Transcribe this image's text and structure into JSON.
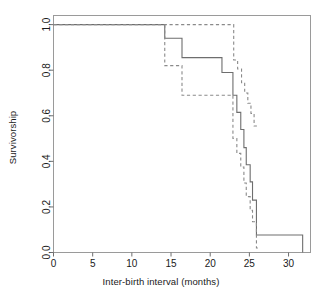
{
  "chart_data": {
    "type": "line",
    "title": "",
    "xlabel": "Inter-birth interval (months)",
    "ylabel": "Survivorship",
    "xlim": [
      0,
      32.8
    ],
    "ylim": [
      0,
      1.04
    ],
    "xticks": [
      0,
      5,
      10,
      15,
      20,
      25,
      30
    ],
    "xticklabels": [
      "0",
      "5",
      "10",
      "15",
      "20",
      "25",
      "30"
    ],
    "yticks": [
      0.0,
      0.2,
      0.4,
      0.6,
      0.8,
      1.0
    ],
    "yticklabels": [
      "0.0",
      "0.2",
      "0.4",
      "0.6",
      "0.8",
      "1.0"
    ],
    "grid": false,
    "legend": null,
    "frame": "box",
    "series": [
      {
        "name": "Survivorship estimate",
        "style": "solid",
        "color": "#6e6e6e",
        "step": "post",
        "x": [
          0,
          14.2,
          14.2,
          16.4,
          16.4,
          21.5,
          21.5,
          22.9,
          22.9,
          23.4,
          23.4,
          23.9,
          23.9,
          24.3,
          24.3,
          24.6,
          24.6,
          25.1,
          25.1,
          25.4,
          25.4,
          25.9,
          25.9,
          31.8,
          31.8
        ],
        "y": [
          1.0,
          1.0,
          0.94,
          0.94,
          0.855,
          0.855,
          0.79,
          0.79,
          0.69,
          0.69,
          0.615,
          0.615,
          0.54,
          0.54,
          0.46,
          0.46,
          0.385,
          0.385,
          0.31,
          0.31,
          0.23,
          0.23,
          0.077,
          0.077,
          0.0
        ]
      },
      {
        "name": "Upper confidence limit",
        "style": "dashed",
        "color": "#8a8a8a",
        "step": "post",
        "x": [
          0,
          14.2,
          14.2,
          23.0,
          23.0,
          23.5,
          23.5,
          24.0,
          24.0,
          24.4,
          24.4,
          24.8,
          24.8,
          25.2,
          25.2,
          25.6,
          25.6,
          26.1
        ],
        "y": [
          1.0,
          1.0,
          1.0,
          1.0,
          0.845,
          0.845,
          0.805,
          0.805,
          0.745,
          0.745,
          0.7,
          0.7,
          0.655,
          0.655,
          0.61,
          0.61,
          0.555,
          0.555
        ]
      },
      {
        "name": "Lower confidence limit",
        "style": "dashed",
        "color": "#8a8a8a",
        "step": "post",
        "x": [
          14.2,
          14.2,
          16.4,
          16.4,
          22.9,
          22.9,
          23.4,
          23.4,
          23.9,
          23.9,
          24.3,
          24.3,
          24.6,
          24.6,
          25.1,
          25.1,
          25.4,
          25.4,
          25.9,
          25.9,
          26.1
        ],
        "y": [
          1.0,
          0.82,
          0.82,
          0.69,
          0.69,
          0.5,
          0.5,
          0.435,
          0.435,
          0.375,
          0.375,
          0.305,
          0.305,
          0.245,
          0.245,
          0.185,
          0.185,
          0.135,
          0.135,
          0.02,
          0.02
        ]
      }
    ]
  }
}
